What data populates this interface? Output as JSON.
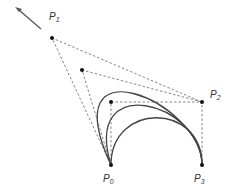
{
  "diagram": {
    "title": "",
    "type": "cubic-bezier-construction",
    "colors": {
      "curve": "#444444",
      "dashed": "#777777",
      "point": "#111111",
      "arrow": "#555555",
      "label": "#333333"
    },
    "points": [
      {
        "name": "P",
        "sub": "0",
        "x": 111,
        "y": 165,
        "label_x": 103,
        "label_y": 174
      },
      {
        "name": "P",
        "sub": "1",
        "x": 52,
        "y": 38,
        "label_x": 49,
        "label_y": 12
      },
      {
        "name": "P",
        "sub": "2",
        "x": 202,
        "y": 102,
        "label_x": 210,
        "label_y": 90
      },
      {
        "name": "P",
        "sub": "3",
        "x": 202,
        "y": 165,
        "label_x": 194,
        "label_y": 174
      }
    ],
    "intermediate_control_points": [
      {
        "x": 82,
        "y": 70
      },
      {
        "x": 111,
        "y": 102
      }
    ],
    "arrow": {
      "x1": 41,
      "y1": 29,
      "x2": 16,
      "y2": 8
    },
    "curves": [
      {
        "p1": [
          52,
          38
        ],
        "p2": [
          202,
          102
        ]
      },
      {
        "p1": [
          82,
          70
        ],
        "p2": [
          202,
          102
        ]
      },
      {
        "p1": [
          111,
          102
        ],
        "p2": [
          202,
          102
        ]
      }
    ]
  }
}
